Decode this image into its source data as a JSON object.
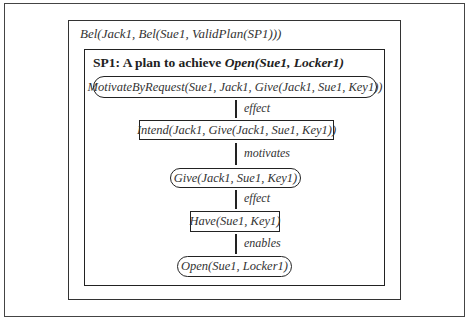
{
  "belief": {
    "label": "Bel(Jack1, Bel(Sue1, ValidPlan(SP1)))"
  },
  "plan": {
    "title_prefix": "SP1:  A plan to achieve ",
    "title_goal": "Open(Sue1, Locker1)"
  },
  "nodes": [
    {
      "label": "MotivateByRequest(Sue1, Jack1, Give(Jack1, Sue1, Key1))",
      "shape": "pill"
    },
    {
      "label": "Intend(Jack1, Give(Jack1, Sue1, Key1))",
      "shape": "rect"
    },
    {
      "label": "Give(Jack1, Sue1, Key1)",
      "shape": "pill"
    },
    {
      "label": "Have(Sue1, Key1)",
      "shape": "rect"
    },
    {
      "label": "Open(Sue1, Locker1)",
      "shape": "pill"
    }
  ],
  "edges": [
    {
      "label": "effect"
    },
    {
      "label": "motivates"
    },
    {
      "label": "effect"
    },
    {
      "label": "enables"
    }
  ]
}
